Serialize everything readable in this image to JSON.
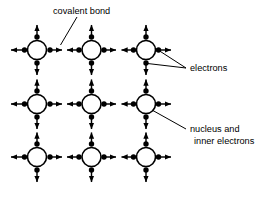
{
  "diagram": {
    "background_color": "#ffffff",
    "ink_color": "#000000",
    "labels": {
      "covalent_bond": "covalent bond",
      "electrons": "electrons",
      "nucleus_line1": "nucleus and",
      "nucleus_line2": "inner electrons"
    },
    "lattice": {
      "rows": 3,
      "cols": 3,
      "atom_x": [
        37,
        91.5,
        146
      ],
      "atom_y": [
        50,
        104,
        157
      ],
      "atom_radius": 9.5,
      "atom_fill": "#ffffff",
      "atom_stroke": "#000000"
    },
    "legend_items": [
      {
        "name": "covalent-bond",
        "text": "covalent bond"
      },
      {
        "name": "electrons",
        "text": "electrons"
      },
      {
        "name": "nucleus-and-inner-electrons",
        "text": "nucleus and inner electrons"
      }
    ]
  }
}
